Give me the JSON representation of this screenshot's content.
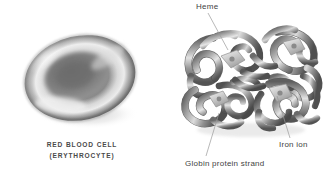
{
  "figure": {
    "style": "grayscale biology illustration",
    "background_color": "#ffffff",
    "line_color": "#8d8d8d",
    "text_color": "#3f3f3f",
    "caption_color": "#4a4a4a"
  },
  "red_blood_cell": {
    "caption_line_1": "RED BLOOD CELL",
    "caption_line_2": "(ERYTHROCYTE)",
    "shape": "biconcave disc",
    "icon": "red-blood-cell-icon"
  },
  "hemoglobin": {
    "icon": "hemoglobin-molecule-icon",
    "labels": {
      "heme": "Heme",
      "iron_ion": "Iron ion",
      "globin_protein_strand": "Globin protein strand"
    }
  }
}
